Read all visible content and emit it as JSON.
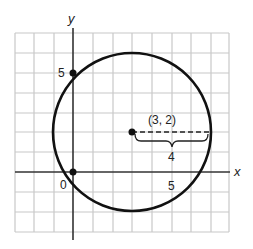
{
  "diagram": {
    "type": "coordinate-plane-circle",
    "axes": {
      "x_label": "x",
      "y_label": "y"
    },
    "grid": {
      "x_min": -3,
      "x_max": 8,
      "y_min": -3,
      "y_max": 7,
      "unit": 1
    },
    "circle": {
      "center": [
        3,
        2
      ],
      "radius": 4
    },
    "labels": {
      "center": "(3, 2)",
      "radius": "4",
      "origin": "0",
      "x_tick": "5",
      "y_tick": "5"
    },
    "points": [
      {
        "name": "center",
        "coords": [
          3,
          2
        ]
      },
      {
        "name": "origin",
        "coords": [
          0,
          0
        ]
      },
      {
        "name": "y-five",
        "coords": [
          0,
          5
        ]
      }
    ],
    "colors": {
      "grid": "#c8c8c8",
      "axis": "#333333",
      "circle": "#111111"
    }
  }
}
